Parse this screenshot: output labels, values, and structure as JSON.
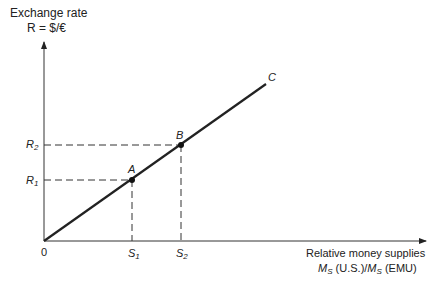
{
  "y_axis": {
    "title_line1": "Exchange rate",
    "title_line2": "R = $/€"
  },
  "x_axis": {
    "title_line1": "Relative money supplies",
    "title_line2_m1": "M",
    "title_line2_s1": "S",
    "title_line2_mid": " (U.S.)/",
    "title_line2_m2": "M",
    "title_line2_s2": "S",
    "title_line2_end": " (EMU)"
  },
  "origin_label": "0",
  "curve_label": "C",
  "points": [
    {
      "label": "A",
      "r_label": "R",
      "r_sub": "1",
      "s_label": "S",
      "s_sub": "1"
    },
    {
      "label": "B",
      "r_label": "R",
      "r_sub": "2",
      "s_label": "S",
      "s_sub": "2"
    }
  ],
  "colors": {
    "line": "#222222",
    "dash": "#333333"
  }
}
